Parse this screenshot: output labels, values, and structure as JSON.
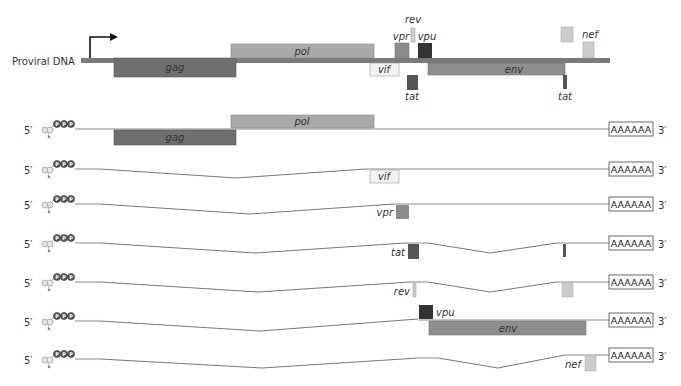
{
  "diagram": {
    "title_label": "Proviral DNA",
    "colors": {
      "dna_bar": "#7a7a7a",
      "gag": "#6f6f6f",
      "pol": "#a9a9a9",
      "vif": "#f2f2f2",
      "vpr": "#8c8c8c",
      "rev": "#cfcfcf",
      "vpu": "#333333",
      "tat": "#555555",
      "env": "#8e8e8e",
      "nef": "#cccccc",
      "rna_line": "#c4c4c4",
      "intron_line": "#666666"
    },
    "proviral_genes": [
      {
        "name": "gag",
        "label": "gag"
      },
      {
        "name": "pol",
        "label": "pol"
      },
      {
        "name": "vif",
        "label": "vif"
      },
      {
        "name": "vpr",
        "label": "vpr"
      },
      {
        "name": "rev",
        "label": "rev"
      },
      {
        "name": "vpu",
        "label": "vpu"
      },
      {
        "name": "tat",
        "label": "tat"
      },
      {
        "name": "env",
        "label": "env"
      },
      {
        "name": "nef",
        "label": "nef"
      },
      {
        "name": "tat2",
        "label": "tat"
      }
    ],
    "transcripts": [
      {
        "five_prime": "5′",
        "cap": "PPP",
        "polyA": "AAAAAA",
        "three_prime": "3′",
        "genes": [
          "gag",
          "pol"
        ]
      },
      {
        "five_prime": "5′",
        "cap": "PPP",
        "polyA": "AAAAAA",
        "three_prime": "3′",
        "genes": [
          "vif"
        ]
      },
      {
        "five_prime": "5′",
        "cap": "PPP",
        "polyA": "AAAAAA",
        "three_prime": "3′",
        "genes": [
          "vpr"
        ]
      },
      {
        "five_prime": "5′",
        "cap": "PPP",
        "polyA": "AAAAAA",
        "three_prime": "3′",
        "genes": [
          "tat"
        ]
      },
      {
        "five_prime": "5′",
        "cap": "PPP",
        "polyA": "AAAAAA",
        "three_prime": "3′",
        "genes": [
          "rev"
        ]
      },
      {
        "five_prime": "5′",
        "cap": "PPP",
        "polyA": "AAAAAA",
        "three_prime": "3′",
        "genes": [
          "vpu",
          "env"
        ]
      },
      {
        "five_prime": "5′",
        "cap": "PPP",
        "polyA": "AAAAAA",
        "three_prime": "3′",
        "genes": [
          "nef"
        ]
      }
    ],
    "gene_labels": {
      "gag": "gag",
      "pol": "pol",
      "vif": "vif",
      "vpr": "vpr",
      "rev": "rev",
      "vpu": "vpu",
      "tat": "tat",
      "env": "env",
      "nef": "nef"
    }
  }
}
